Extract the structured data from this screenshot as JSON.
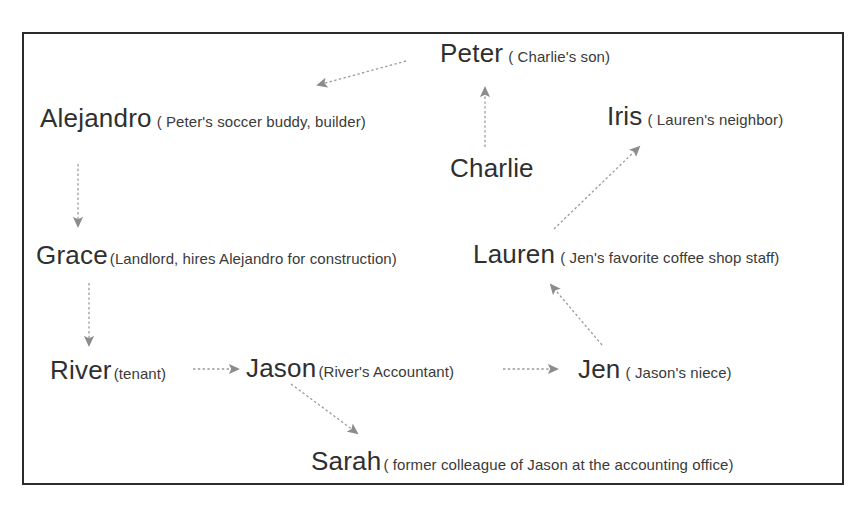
{
  "diagram": {
    "frame": {
      "border_color": "#2b2b2b"
    },
    "text_color": "#2f2f2f",
    "edge_color": "#8c8c8c",
    "nodes": [
      {
        "id": "peter",
        "name": "Peter",
        "descriptor": "( Charlie's son)"
      },
      {
        "id": "alejandro",
        "name": "Alejandro",
        "descriptor": "( Peter's soccer buddy,  builder)"
      },
      {
        "id": "iris",
        "name": "Iris",
        "descriptor": "( Lauren's neighbor)"
      },
      {
        "id": "charlie",
        "name": "Charlie",
        "descriptor": ""
      },
      {
        "id": "grace",
        "name": "Grace",
        "descriptor": "(Landlord, hires Alejandro for construction)"
      },
      {
        "id": "lauren",
        "name": "Lauren",
        "descriptor": "( Jen's favorite coffee shop staff)"
      },
      {
        "id": "river",
        "name": "River",
        "descriptor": "(tenant)"
      },
      {
        "id": "jason",
        "name": "Jason",
        "descriptor": "(River's Accountant)"
      },
      {
        "id": "jen",
        "name": "Jen",
        "descriptor": "( Jason's niece)"
      },
      {
        "id": "sarah",
        "name": "Sarah",
        "descriptor": "( former colleague of Jason at the accounting office)"
      }
    ],
    "edges": [
      {
        "id": "peter-to-alejandro",
        "from": "peter",
        "to": "alejandro",
        "style": "dotted",
        "direction": "down-left"
      },
      {
        "id": "charlie-to-peter",
        "from": "charlie",
        "to": "peter",
        "style": "dotted",
        "direction": "up"
      },
      {
        "id": "alejandro-to-grace",
        "from": "alejandro",
        "to": "grace",
        "style": "dotted",
        "direction": "down"
      },
      {
        "id": "grace-to-river",
        "from": "grace",
        "to": "river",
        "style": "dotted",
        "direction": "down"
      },
      {
        "id": "river-to-jason",
        "from": "river",
        "to": "jason",
        "style": "dotted",
        "direction": "right"
      },
      {
        "id": "jason-to-jen",
        "from": "jason",
        "to": "jen",
        "style": "dotted",
        "direction": "right"
      },
      {
        "id": "jason-to-sarah",
        "from": "jason",
        "to": "sarah",
        "style": "dotted",
        "direction": "down-right"
      },
      {
        "id": "jen-to-lauren",
        "from": "jen",
        "to": "lauren",
        "style": "dotted",
        "direction": "up-left"
      },
      {
        "id": "lauren-to-iris",
        "from": "lauren",
        "to": "iris",
        "style": "dotted",
        "direction": "up-right"
      }
    ]
  }
}
